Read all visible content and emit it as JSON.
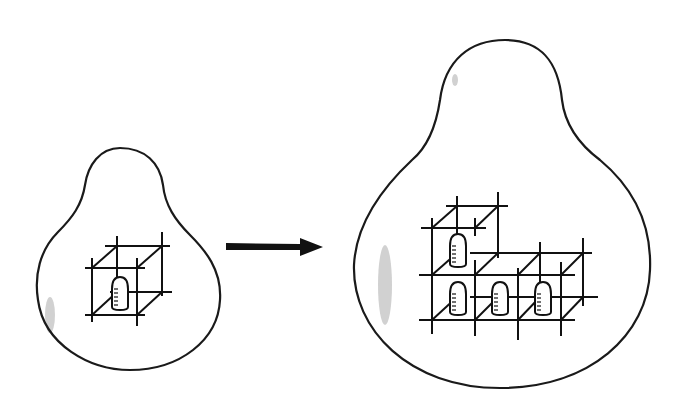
{
  "figure": {
    "colors": {
      "stroke": "#111111",
      "background": "#ffffff",
      "smudge": "#9a9a9a"
    }
  },
  "left_panel": {
    "shape": "small-pear-outline",
    "cell_count": 1
  },
  "arrow": {
    "direction": "right"
  },
  "right_panel": {
    "shape": "large-pear-outline",
    "cell_count": 4,
    "arrangement": "L-shape: 1 cell on top-left, 3 cells in bottom row"
  }
}
